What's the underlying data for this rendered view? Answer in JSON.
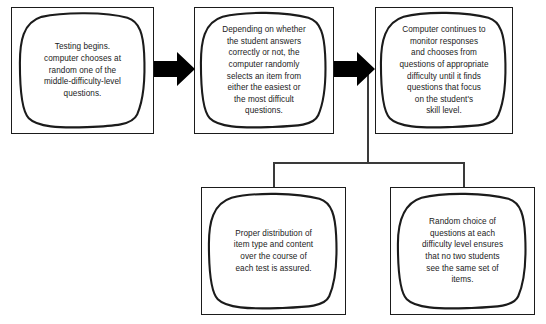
{
  "diagram": {
    "type": "flowchart",
    "canvas": {
      "width": 546,
      "height": 324
    },
    "colors": {
      "background": "#ffffff",
      "box_stroke": "#1b1b1b",
      "blob_stroke": "#1b1b1b",
      "arrow_fill": "#000000",
      "connector_stroke": "#3a3a3a",
      "text": "#1b1b1b"
    },
    "nodes": [
      {
        "id": "step-1",
        "name": "testing-begins-node",
        "text": "Testing begins.\ncomputer chooses at\nrandom one of the\nmiddle-difficulty-level\nquestions.",
        "x": 11,
        "y": 7,
        "w": 143,
        "h": 127
      },
      {
        "id": "step-2",
        "name": "item-selection-node",
        "text": "Depending on whether\nthe student answers\ncorrectly or not, the\ncomputer randomly\nselects an item from\neither the easiest or\nthe most difficult\nquestions.",
        "x": 194,
        "y": 7,
        "w": 140,
        "h": 127
      },
      {
        "id": "step-3",
        "name": "monitor-responses-node",
        "text": "Computer continues to\nmonitor responses\nand chooses from\nquestions of appropriate\ndifficulty until it finds\nquestions that focus\non the student's\nskill level.",
        "x": 375,
        "y": 7,
        "w": 138,
        "h": 127
      },
      {
        "id": "outcome-1",
        "name": "proper-distribution-node",
        "text": "Proper distribution of\nitem type and content\nover the course of\neach test is assured.",
        "x": 201,
        "y": 187,
        "w": 145,
        "h": 128
      },
      {
        "id": "outcome-2",
        "name": "random-choice-node",
        "text": "Random choice of\nquestions at each\ndifficulty level ensures\nthat no two students\nsee the same set of\nitems.",
        "x": 390,
        "y": 187,
        "w": 145,
        "h": 128
      }
    ],
    "arrows": [
      {
        "id": "arrow-1",
        "name": "arrow-step1-to-step2",
        "from": "step-1",
        "to": "step-2",
        "x": 154,
        "y": 52,
        "w": 41,
        "h": 34
      },
      {
        "id": "arrow-2",
        "name": "arrow-step2-to-step3",
        "from": "step-2",
        "to": "step-3",
        "x": 334,
        "y": 52,
        "w": 41,
        "h": 34
      }
    ],
    "connectors": [
      {
        "id": "trunk",
        "name": "connector-trunk-vertical",
        "orientation": "vertical",
        "x": 367,
        "y": 68,
        "length": 95
      },
      {
        "id": "bus",
        "name": "connector-horizontal-bus",
        "orientation": "horizontal",
        "x": 273,
        "y": 162,
        "length": 191
      },
      {
        "id": "drop-left",
        "name": "connector-drop-left",
        "orientation": "vertical",
        "x": 273,
        "y": 162,
        "length": 26
      },
      {
        "id": "drop-right",
        "name": "connector-drop-right",
        "orientation": "vertical",
        "x": 463,
        "y": 162,
        "length": 26
      }
    ]
  }
}
